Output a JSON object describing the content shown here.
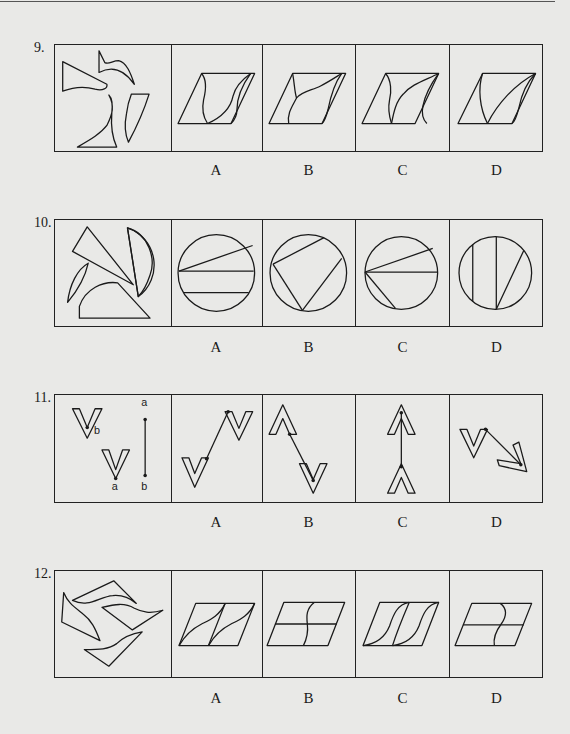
{
  "page": {
    "questions": [
      {
        "number": "9.",
        "stem_description": "Four separate curved/triangular fragments to be assembled",
        "options": [
          {
            "label": "A",
            "description": "Parallelogram divided by two wavy vertical curves"
          },
          {
            "label": "B",
            "description": "Parallelogram with a curve from top-left meeting a diagonal curve"
          },
          {
            "label": "C",
            "description": "Parallelogram with curves converging at top-right corner"
          },
          {
            "label": "D",
            "description": "Parallelogram with three curves converging at top-right corner"
          }
        ]
      },
      {
        "number": "10.",
        "stem_description": "Four circle pieces: triangle wedge, semicircle, crescent, sector",
        "options": [
          {
            "label": "A",
            "description": "Circle with one slanted chord and two horizontal chords"
          },
          {
            "label": "B",
            "description": "Circle with three chords forming an open quadrilateral"
          },
          {
            "label": "C",
            "description": "Circle with three chords radiating from left point"
          },
          {
            "label": "D",
            "description": "Circle with two vertical chords and one slanted chord"
          }
        ]
      },
      {
        "number": "11.",
        "stem_description": "Two V shapes with points b and a, and a segment from a to b",
        "stem_labels": [
          "b",
          "a",
          "a",
          "b"
        ],
        "options": [
          {
            "label": "A",
            "description": "Two V shapes joined by a rising segment"
          },
          {
            "label": "B",
            "description": "Inverted V above and V below joined by a descending segment"
          },
          {
            "label": "C",
            "description": "Two inverted V shapes joined by a vertical segment"
          },
          {
            "label": "D",
            "description": "V and rotated V joined by a diagonal segment"
          }
        ]
      },
      {
        "number": "12.",
        "stem_description": "Four curved quadrilateral pieces arranged in a pinwheel",
        "options": [
          {
            "label": "A",
            "description": "Parallelogram split into two halves each with an S-curve"
          },
          {
            "label": "B",
            "description": "Parallelogram with horizontal midline and S-curve"
          },
          {
            "label": "C",
            "description": "Parallelogram with two S-curves"
          },
          {
            "label": "D",
            "description": "Parallelogram with horizontal midline and reversed S-curve"
          }
        ]
      }
    ]
  }
}
